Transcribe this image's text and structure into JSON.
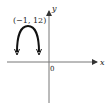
{
  "diagram": {
    "type": "coordinate-graph",
    "axes": {
      "x_label": "x",
      "y_label": "y",
      "origin_label": "0"
    },
    "curve": {
      "shape": "parabola-opening-down",
      "vertex_label": "(−1, 12)",
      "vertex": [
        -1,
        12
      ],
      "color": "#111111"
    },
    "colors": {
      "axis": "#666666",
      "curve": "#111111",
      "background": "#ffffff"
    }
  }
}
